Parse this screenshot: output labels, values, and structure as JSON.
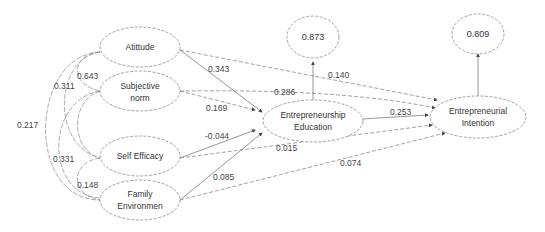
{
  "diagram": {
    "type": "structural-equation-model",
    "nodes": {
      "attitude": {
        "label": "Atittude"
      },
      "subjective_norm": {
        "line1": "Subjective",
        "line2": "norm"
      },
      "self_efficacy": {
        "label": "Self Efficacy"
      },
      "family_environment": {
        "line1": "Family",
        "line2": "Environmen"
      },
      "entrepreneurship_education": {
        "line1": "Entrepreneurship",
        "line2": "Education"
      },
      "entrepreneurial_intention": {
        "line1": "Entrepreneurial",
        "line2": "Intention"
      },
      "r2_education": {
        "label": "0.873"
      },
      "r2_intention": {
        "label": "0.809"
      }
    },
    "paths": {
      "attitude_to_education": "0.343",
      "attitude_to_intention": "0.140",
      "subjective_norm_to_education": "0.169",
      "subjective_norm_to_intention": "0.286",
      "self_efficacy_to_education": "-0.044",
      "self_efficacy_to_intention": "0.015",
      "family_to_education": "0.085",
      "family_to_intention": "0.074",
      "education_to_intention": "0.253"
    },
    "correlations": {
      "attitude_subjective_norm": "0.643",
      "attitude_self_efficacy": "0.311",
      "attitude_family": "0.217",
      "subjective_norm_family": "0.331",
      "self_efficacy_family": "0.148"
    }
  }
}
